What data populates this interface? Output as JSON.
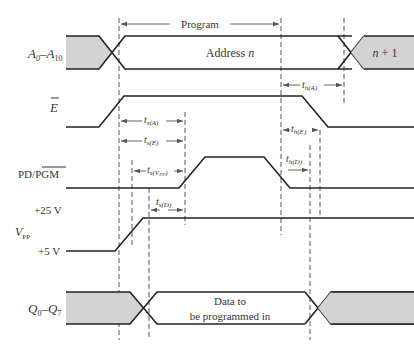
{
  "diagram": {
    "type": "timing-diagram",
    "signals": [
      {
        "id": "address",
        "label_main": "A",
        "label_sub1": "0",
        "label_dash": "–A",
        "label_sub2": "10",
        "states": [
          "Address n",
          "n + 1"
        ]
      },
      {
        "id": "enable",
        "label_main": "E",
        "overbar": true
      },
      {
        "id": "pd_pgm",
        "label_main": "PD/",
        "label_bar": "PGM"
      },
      {
        "id": "vpp",
        "label_main": "V",
        "label_sub": "PP",
        "levels": [
          "+25 V",
          "+5 V"
        ]
      },
      {
        "id": "data",
        "label_main": "Q",
        "label_sub1": "0",
        "label_dash": "–Q",
        "label_sub2": "7",
        "state": [
          "Data to",
          "be programmed in"
        ]
      }
    ],
    "program_label": "Program",
    "address_state": {
      "word": "Address ",
      "var": "n"
    },
    "next_address": {
      "var": "n",
      "suffix": " + 1"
    },
    "data_text": {
      "line1": "Data to",
      "line2": "be programmed in"
    },
    "vpp_high": "+25 V",
    "vpp_low": "+5 V",
    "timings": [
      {
        "id": "ts_A",
        "t": "t",
        "sub": "s(A)"
      },
      {
        "id": "ts_E",
        "t": "t",
        "sub": "s(E)"
      },
      {
        "id": "ts_Vpp",
        "t": "t",
        "sub": "s(V",
        "sub2": "PP",
        "sub3": ")"
      },
      {
        "id": "ts_D",
        "t": "t",
        "sub": "s(D)"
      },
      {
        "id": "th_A",
        "t": "t",
        "sub": "h(A)"
      },
      {
        "id": "th_E",
        "t": "t",
        "sub": "h(E)"
      },
      {
        "id": "th_D",
        "t": "t",
        "sub": "h(D)"
      }
    ]
  }
}
